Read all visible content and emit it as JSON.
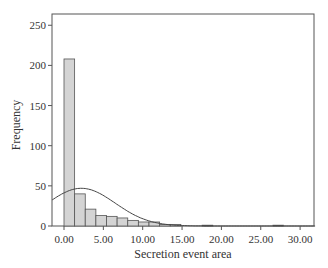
{
  "chart_data": {
    "type": "bar",
    "subtype": "histogram_with_normal_curve",
    "title": "",
    "xlabel": "Secretion event area",
    "ylabel": "Frequency",
    "xlim": [
      -1.5,
      32
    ],
    "ylim": [
      0,
      260
    ],
    "x_ticks": [
      "0.00",
      "5.00",
      "10.00",
      "15.00",
      "20.00",
      "25.00",
      "30.00"
    ],
    "x_tick_values": [
      0,
      5,
      10,
      15,
      20,
      25,
      30
    ],
    "y_ticks": [
      "0",
      "50",
      "100",
      "150",
      "200",
      "250"
    ],
    "y_tick_values": [
      0,
      50,
      100,
      150,
      200,
      250
    ],
    "grid": false,
    "legend": null,
    "bin_width": 1.35,
    "bins": [
      {
        "start": 0.0,
        "count": 208
      },
      {
        "start": 1.35,
        "count": 40
      },
      {
        "start": 2.7,
        "count": 21
      },
      {
        "start": 4.05,
        "count": 13
      },
      {
        "start": 5.4,
        "count": 12
      },
      {
        "start": 6.75,
        "count": 10
      },
      {
        "start": 8.1,
        "count": 7
      },
      {
        "start": 9.45,
        "count": 5
      },
      {
        "start": 10.8,
        "count": 5
      },
      {
        "start": 12.15,
        "count": 2
      },
      {
        "start": 13.5,
        "count": 2
      },
      {
        "start": 17.55,
        "count": 1
      },
      {
        "start": 26.55,
        "count": 1
      }
    ],
    "normal_curve": {
      "mean": 2.2,
      "peak": 47,
      "sd": 4.3,
      "description": "Fitted normal distribution overlay"
    }
  }
}
